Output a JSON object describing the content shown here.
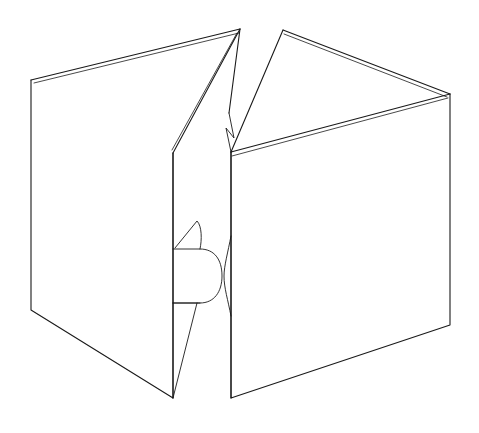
{
  "document": {
    "title": "Open cardboard box line drawing",
    "kind": "line-art-illustration",
    "subject": "open corrugated box seen from above with two raised top flaps and a front hand-hole tab",
    "background_color": "#ffffff",
    "stroke_color": "#1a1a1a",
    "width": 479,
    "height": 433
  },
  "figure": {
    "name": "open-box",
    "parts": [
      {
        "name": "left-side-panel",
        "label": "Left side panel"
      },
      {
        "name": "right-side-panel",
        "label": "Right side panel"
      },
      {
        "name": "left-top-flap",
        "label": "Left top flap (raised)"
      },
      {
        "name": "right-top-flap",
        "label": "Right top flap (raised)"
      },
      {
        "name": "center-seam",
        "label": "Center seam"
      },
      {
        "name": "hand-hole-tab",
        "label": "Hand-hole tab"
      },
      {
        "name": "tab-tongue",
        "label": "Tab tongue"
      },
      {
        "name": "upper-notch",
        "label": "Upper seam notch"
      }
    ],
    "line_style": {
      "stroke_width": 1.1,
      "fill": "none"
    }
  },
  "geometry": {
    "left_side_panel": "M 31,80 L 173,153 L 173,398 L 31,310 Z",
    "left_panel_outer": "M 31,80 L 31,310 L 173,398 L 173,153",
    "left_flap_top_edge": "M 31,80 L 240,29",
    "left_flap_inner_edge": "M 34,83 L 239,33",
    "left_flap_fold": "M 240,29 L 173,153",
    "left_flap_fold_inner": "M 237,33 L 172,150",
    "left_flap_ridge": "M 240,29 L 229,113",
    "right_flap_top_edge": "M 283,30 L 450,94",
    "right_flap_inner_edge": "M 284,34 L 447,97",
    "right_flap_left_edge": "M 283,30 L 231,152",
    "right_flap_bottom_edge": "M 231,152 L 450,94",
    "right_flap_bottom_inner": "M 232,156 L 448,98",
    "right_side_panel": "M 231,152 L 450,94 L 450,325 L 231,398 Z",
    "right_panel_outer": "M 231,152 L 231,398 L 450,325 L 450,94",
    "center_seam_left": "M 173,153 L 173,398",
    "center_seam_right": "M 231,152 L 231,398",
    "upper_notch": "M 229,113 L 234,138 L 226,128 L 231,152",
    "tab_tongue": "M 175,248 L 197,221 C 202,226 202,240 200,249",
    "tab_body": "M 173,249 L 200,249 C 214,249 222,259 222,276 C 222,292 214,303 200,303 L 173,303",
    "tab_right_bulge": "M 231,236 C 228,252 224,266 224,276 C 224,288 228,300 231,316",
    "tab_diagonal": "M 197,303 L 173,398",
    "tab_foot": "M 173,303 L 200,303"
  },
  "colors": {
    "background": "#ffffff",
    "line": "#1a1a1a",
    "face_fill": "#ffffff"
  },
  "chart_data": null
}
